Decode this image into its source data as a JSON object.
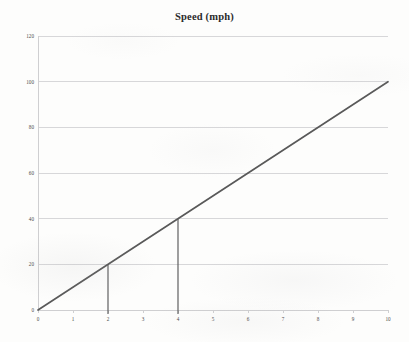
{
  "chart_data": {
    "type": "line",
    "title": "Speed (mph)",
    "xlabel": "",
    "ylabel": "",
    "xlim": [
      0,
      10
    ],
    "ylim": [
      0,
      120
    ],
    "grid": true,
    "grid_axis": "y",
    "legend": false,
    "x_ticks": [
      "0",
      "1",
      "2",
      "3",
      "4",
      "5",
      "6",
      "7",
      "8",
      "9",
      "10"
    ],
    "x_tick_values": [
      0,
      1,
      2,
      3,
      4,
      5,
      6,
      7,
      8,
      9,
      10
    ],
    "y_ticks": [
      "0",
      "20",
      "40",
      "60",
      "80",
      "100",
      "120"
    ],
    "y_tick_values": [
      0,
      20,
      40,
      60,
      80,
      100,
      120
    ],
    "series": [
      {
        "name": "Speed",
        "type": "line",
        "color": "#595959",
        "x": [
          0,
          10
        ],
        "values": [
          0,
          100
        ]
      }
    ],
    "annotations": [
      {
        "name": "drop-line-x2",
        "type": "vertical-segment",
        "x": 2,
        "y_from": 20,
        "y_to": 0,
        "color": "#595959"
      },
      {
        "name": "drop-line-x4",
        "type": "vertical-segment",
        "x": 4,
        "y_from": 40,
        "y_to": 0,
        "color": "#595959"
      }
    ],
    "colors": {
      "line": "#595959",
      "gridline": "#d7d7d9",
      "axis": "#cfcfd1",
      "tick_text": "#4a4a4a",
      "title_text": "#2b2b2b",
      "background": "#fdfdfc"
    }
  }
}
